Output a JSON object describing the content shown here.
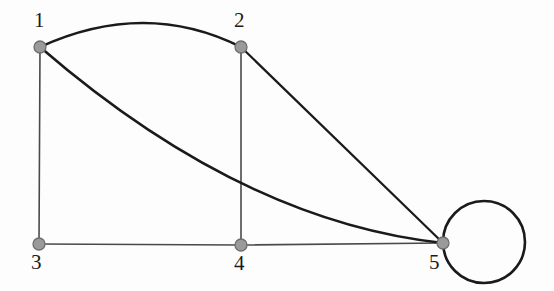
{
  "figure": {
    "name": "undirected-graph-diagram",
    "background_color": "#fdfdfd",
    "width": 554,
    "height": 291
  },
  "style": {
    "vertex_fill": "#9a9a9a",
    "vertex_stroke": "#6e6e6e",
    "vertex_radius": 6,
    "edge_color_straight": "#4a4a4a",
    "edge_color_curved": "#1a1a1a",
    "edge_width_straight": 1.6,
    "edge_width_curved": 2.6,
    "label_color": "#1a1a1a",
    "label_font_size": 21
  },
  "chart_data": {
    "type": "graph",
    "title": "",
    "directed": false,
    "vertices": [
      {
        "id": "1",
        "label": "1",
        "x": 40,
        "y": 47,
        "label_x": 34,
        "label_y": 10
      },
      {
        "id": "2",
        "label": "2",
        "x": 241,
        "y": 47,
        "label_x": 234,
        "label_y": 10
      },
      {
        "id": "3",
        "label": "3",
        "x": 39,
        "y": 244,
        "label_x": 31,
        "label_y": 252
      },
      {
        "id": "4",
        "label": "4",
        "x": 241,
        "y": 245,
        "label_x": 234,
        "label_y": 253
      },
      {
        "id": "5",
        "label": "5",
        "x": 443,
        "y": 243,
        "label_x": 429,
        "label_y": 252
      }
    ],
    "edges": [
      {
        "from": "1",
        "to": "2",
        "kind": "curved",
        "bow": "up",
        "apex_x": 145,
        "apex_y": 23
      },
      {
        "from": "1",
        "to": "3",
        "kind": "straight"
      },
      {
        "from": "1",
        "to": "5",
        "kind": "curved",
        "bow": "down",
        "crossing_x": 241,
        "crossing_y": 183
      },
      {
        "from": "2",
        "to": "4",
        "kind": "straight"
      },
      {
        "from": "2",
        "to": "5",
        "kind": "straight"
      },
      {
        "from": "3",
        "to": "4",
        "kind": "straight"
      },
      {
        "from": "4",
        "to": "5",
        "kind": "straight"
      },
      {
        "from": "5",
        "to": "5",
        "kind": "self-loop",
        "loop_center_x": 484,
        "loop_center_y": 242,
        "loop_radius": 41
      }
    ],
    "degree_sequence": {
      "1": 3,
      "2": 3,
      "3": 2,
      "4": 3,
      "5": 5
    }
  }
}
